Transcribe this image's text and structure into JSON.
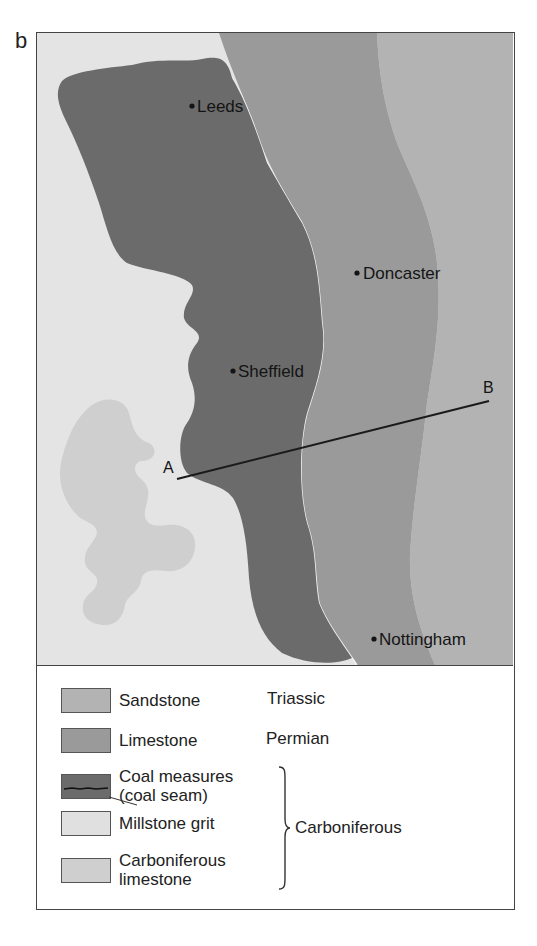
{
  "figure": {
    "panel_label": "b"
  },
  "map": {
    "cities": [
      {
        "name": "Leeds",
        "x": 155,
        "y": 73
      },
      {
        "name": "Doncaster",
        "x": 320,
        "y": 240
      },
      {
        "name": "Sheffield",
        "x": 196,
        "y": 338
      },
      {
        "name": "Nottingham",
        "x": 337,
        "y": 606
      }
    ],
    "section_line": {
      "start_label": "A",
      "end_label": "B",
      "start": {
        "x": 140,
        "y": 446
      },
      "end": {
        "x": 452,
        "y": 368
      }
    },
    "colors": {
      "sandstone": "#b3b3b3",
      "limestone": "#9a9a9a",
      "coal_measures": "#6b6b6b",
      "millstone_grit": "#e4e4e4",
      "carboniferous_limestone": "#cfcfcf"
    }
  },
  "legend": {
    "items": [
      {
        "label": "Sandstone",
        "period": "Triassic"
      },
      {
        "label": "Limestone",
        "period": "Permian"
      },
      {
        "label": "Coal measures",
        "sublabel": "(coal seam)"
      },
      {
        "label": "Millstone grit"
      },
      {
        "label": "Carboniferous",
        "sublabel": "limestone"
      }
    ],
    "grouped_period": "Carboniferous"
  }
}
